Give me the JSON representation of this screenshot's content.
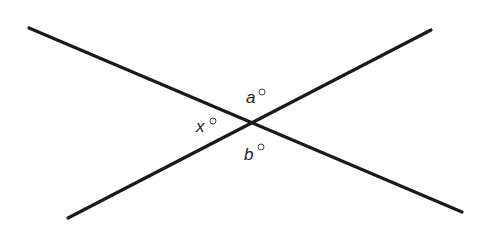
{
  "diagram": {
    "type": "intersecting-lines",
    "lines": [
      {
        "id": "line-1",
        "direction": "top-left to bottom-right"
      },
      {
        "id": "line-2",
        "direction": "bottom-left to top-right"
      }
    ],
    "angles": [
      {
        "variable": "a",
        "unit": "degrees",
        "position": "top"
      },
      {
        "variable": "x",
        "unit": "degrees",
        "position": "left"
      },
      {
        "variable": "b",
        "unit": "degrees",
        "position": "bottom"
      }
    ],
    "colors": {
      "line": "#1a1a1a",
      "label": "#222222",
      "background": "#ffffff"
    }
  }
}
